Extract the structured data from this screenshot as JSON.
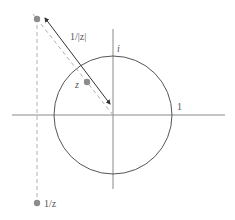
{
  "diagram": {
    "labels": {
      "imag_unit": "i",
      "real_unit": "1",
      "z": "z",
      "modulus": "1/|z|",
      "inverse": "1/z"
    },
    "colors": {
      "axis": "#8a8a8a",
      "circle": "#555555",
      "dashed": "#b0b0b0",
      "arrow": "#333333",
      "point": "#8c8c8c"
    }
  }
}
